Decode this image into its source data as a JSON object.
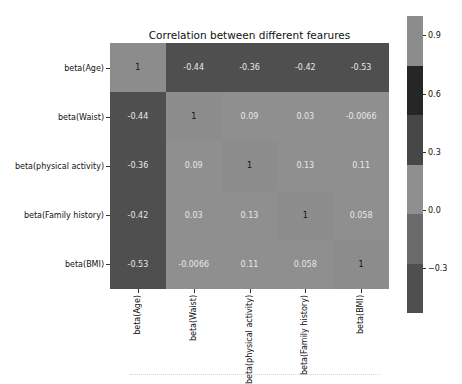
{
  "chart_data": {
    "type": "heatmap",
    "title": "Correlation between different fearures",
    "xlabel": "",
    "ylabel": "",
    "row_labels": [
      "beta(Age)",
      "beta(Waist)",
      "beta(physical activity)",
      "beta(Family history)",
      "beta(BMI)"
    ],
    "col_labels": [
      "beta(Age)",
      "beta(Waist)",
      "beta(physical activity)",
      "beta(Family history)",
      "beta(BMI)"
    ],
    "values": [
      [
        1,
        -0.44,
        -0.36,
        -0.42,
        -0.53
      ],
      [
        -0.44,
        1,
        0.09,
        0.03,
        -0.0066
      ],
      [
        -0.36,
        0.09,
        1,
        0.13,
        0.11
      ],
      [
        -0.42,
        0.03,
        0.13,
        1,
        0.058
      ],
      [
        -0.53,
        -0.0066,
        0.11,
        0.058,
        1
      ]
    ],
    "display_values": [
      [
        "1",
        "-0.44",
        "-0.36",
        "-0.42",
        "-0.53"
      ],
      [
        "-0.44",
        "1",
        "0.09",
        "0.03",
        "-0.0066"
      ],
      [
        "-0.36",
        "0.09",
        "1",
        "0.13",
        "0.11"
      ],
      [
        "-0.42",
        "0.03",
        "0.13",
        "1",
        "0.058"
      ],
      [
        "-0.53",
        "-0.0066",
        "0.11",
        "0.058",
        "1"
      ]
    ],
    "colorbar": {
      "ticks": [
        "0.9",
        "0.6",
        "0.3",
        "0.0",
        "−0.3"
      ],
      "range": [
        -0.53,
        1.0
      ],
      "bands_top_to_bottom": [
        "#8c8c8c",
        "#262626",
        "#474747",
        "#8f8f8f",
        "#6b6b6b",
        "#4f4f4f"
      ]
    },
    "cell_colors": [
      [
        "#8c8c8c",
        "#4f4f4f",
        "#4f4f4f",
        "#4f4f4f",
        "#4f4f4f"
      ],
      [
        "#4f4f4f",
        "#8c8c8c",
        "#8f8f8f",
        "#8f8f8f",
        "#8f8f8f"
      ],
      [
        "#4f4f4f",
        "#8f8f8f",
        "#8c8c8c",
        "#8f8f8f",
        "#8f8f8f"
      ],
      [
        "#4f4f4f",
        "#8f8f8f",
        "#8f8f8f",
        "#8c8c8c",
        "#8f8f8f"
      ],
      [
        "#4f4f4f",
        "#8f8f8f",
        "#8f8f8f",
        "#8f8f8f",
        "#8c8c8c"
      ]
    ],
    "grid": false,
    "legend": "colorbar-right"
  }
}
